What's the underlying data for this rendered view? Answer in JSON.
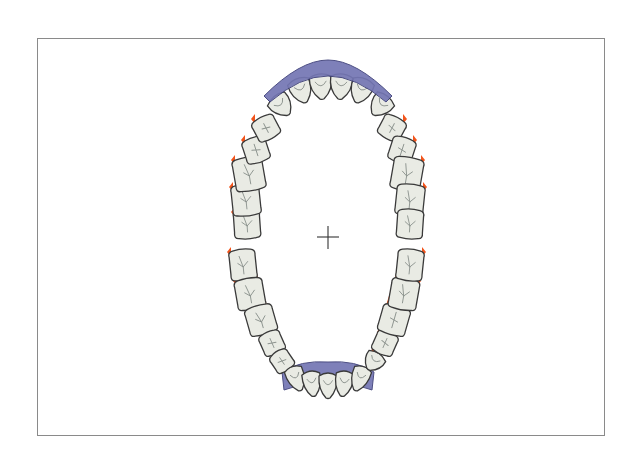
{
  "diagram": {
    "type": "dental-chart",
    "view": "occlusal, both arches",
    "colors": {
      "tooth_fill": "#e9ebe4",
      "tooth_outline": "#3a3a3a",
      "gum_recession_marker": "#f2541b",
      "prosthesis": "#7476b4"
    },
    "upper_arch": {
      "teeth": [
        {
          "id": "UR8",
          "side": "right",
          "kind": "molar",
          "gum_marker": true
        },
        {
          "id": "UR7",
          "side": "right",
          "kind": "molar",
          "gum_marker": true
        },
        {
          "id": "UR6",
          "side": "right",
          "kind": "molar",
          "gum_marker": true
        },
        {
          "id": "UR5",
          "side": "right",
          "kind": "premolar",
          "gum_marker": true
        },
        {
          "id": "UR4",
          "side": "right",
          "kind": "premolar",
          "gum_marker": true
        },
        {
          "id": "UR3",
          "side": "right",
          "kind": "canine",
          "gum_marker": false,
          "prosthesis": true
        },
        {
          "id": "UR2",
          "side": "right",
          "kind": "incisor",
          "gum_marker": false,
          "prosthesis": true
        },
        {
          "id": "UR1",
          "side": "right",
          "kind": "incisor",
          "gum_marker": false,
          "prosthesis": true
        },
        {
          "id": "UL1",
          "side": "left",
          "kind": "incisor",
          "gum_marker": false,
          "prosthesis": true
        },
        {
          "id": "UL2",
          "side": "left",
          "kind": "incisor",
          "gum_marker": false,
          "prosthesis": true
        },
        {
          "id": "UL3",
          "side": "left",
          "kind": "canine",
          "gum_marker": false,
          "prosthesis": true
        },
        {
          "id": "UL4",
          "side": "left",
          "kind": "premolar",
          "gum_marker": true
        },
        {
          "id": "UL5",
          "side": "left",
          "kind": "premolar",
          "gum_marker": true
        },
        {
          "id": "UL6",
          "side": "left",
          "kind": "molar",
          "gum_marker": true
        },
        {
          "id": "UL7",
          "side": "left",
          "kind": "molar",
          "gum_marker": true
        },
        {
          "id": "UL8",
          "side": "left",
          "kind": "molar",
          "gum_marker": false
        }
      ]
    },
    "lower_arch": {
      "teeth": [
        {
          "id": "LR8",
          "side": "right",
          "kind": "molar",
          "gum_marker": true
        },
        {
          "id": "LR7",
          "side": "right",
          "kind": "molar",
          "gum_marker": true
        },
        {
          "id": "LR6",
          "side": "right",
          "kind": "molar",
          "gum_marker": true
        },
        {
          "id": "LR5",
          "side": "right",
          "kind": "premolar",
          "gum_marker": true
        },
        {
          "id": "LR4",
          "side": "right",
          "kind": "premolar",
          "gum_marker": true
        },
        {
          "id": "LR3",
          "side": "right",
          "kind": "canine",
          "gum_marker": false,
          "prosthesis": true
        },
        {
          "id": "LR2",
          "side": "right",
          "kind": "incisor",
          "gum_marker": false,
          "prosthesis": true
        },
        {
          "id": "LR1",
          "side": "right",
          "kind": "incisor",
          "gum_marker": false,
          "prosthesis": true
        },
        {
          "id": "LL1",
          "side": "left",
          "kind": "incisor",
          "gum_marker": false,
          "prosthesis": true
        },
        {
          "id": "LL2",
          "side": "left",
          "kind": "incisor",
          "gum_marker": false,
          "prosthesis": true
        },
        {
          "id": "LL3",
          "side": "left",
          "kind": "canine",
          "gum_marker": false,
          "prosthesis": true
        },
        {
          "id": "LL4",
          "side": "left",
          "kind": "premolar",
          "gum_marker": true
        },
        {
          "id": "LL5",
          "side": "left",
          "kind": "premolar",
          "gum_marker": true
        },
        {
          "id": "LL6",
          "side": "left",
          "kind": "molar",
          "gum_marker": true
        },
        {
          "id": "LL7",
          "side": "left",
          "kind": "molar",
          "gum_marker": true
        },
        {
          "id": "LL8",
          "side": "left",
          "kind": "molar",
          "gum_marker": true
        }
      ]
    },
    "center_marker": "crosshair-icon"
  }
}
